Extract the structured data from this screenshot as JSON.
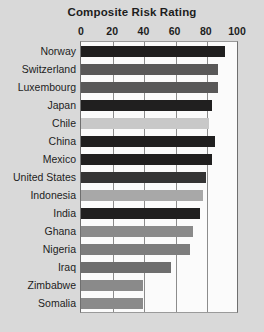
{
  "chart_data": {
    "type": "bar",
    "orientation": "horizontal",
    "title": "Composite Risk Rating",
    "xlabel": "",
    "ylabel": "",
    "xlim": [
      0,
      100
    ],
    "ticks": [
      0,
      20,
      40,
      60,
      80,
      100
    ],
    "grid": true,
    "legend": "none",
    "categories": [
      "Norway",
      "Switzerland",
      "Luxembourg",
      "Japan",
      "Chile",
      "China",
      "Mexico",
      "United States",
      "Indonesia",
      "India",
      "Ghana",
      "Nigeria",
      "Iraq",
      "Zimbabwe",
      "Somalia"
    ],
    "values": [
      92,
      88,
      88,
      84,
      82,
      86,
      84,
      80,
      78,
      76,
      72,
      70,
      58,
      40,
      40
    ],
    "bar_colors": [
      "#201f1f",
      "#595858",
      "#595858",
      "#201f1f",
      "#c8c8c8",
      "#201f1f",
      "#201f1f",
      "#353434",
      "#a8a8a8",
      "#201f1f",
      "#8a8a8a",
      "#7d7d7d",
      "#6e6e6e",
      "#8a8a8a",
      "#8a8a8a"
    ]
  },
  "colors": {
    "background": "#d9d9d9",
    "plot_background": "#fbfbfb",
    "axis": "#6f6f6f",
    "gridline": "#8c8c8c",
    "text": "#1d1d1d"
  }
}
